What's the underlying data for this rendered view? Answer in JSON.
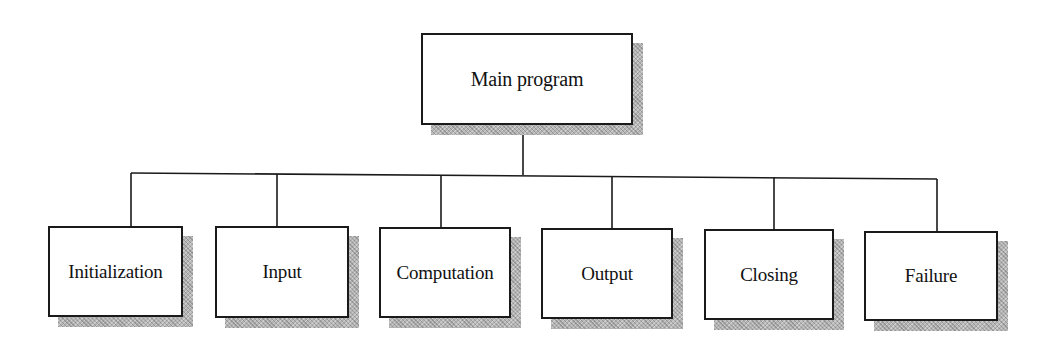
{
  "diagram": {
    "type": "hierarchy-chart",
    "root": {
      "id": "main",
      "label": "Main program"
    },
    "children": [
      {
        "id": "initialization",
        "label": "Initialization"
      },
      {
        "id": "input",
        "label": "Input"
      },
      {
        "id": "computation",
        "label": "Computation"
      },
      {
        "id": "output",
        "label": "Output"
      },
      {
        "id": "closing",
        "label": "Closing"
      },
      {
        "id": "failure",
        "label": "Failure"
      }
    ],
    "colors": {
      "line": "#1a1a1a",
      "box_fill": "#ffffff",
      "shadow": "#b4b4b4"
    }
  }
}
